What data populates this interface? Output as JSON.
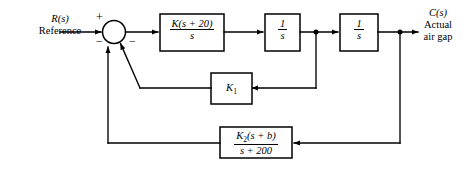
{
  "diagram": {
    "background_color": "#ffffff",
    "line_color": "#000000",
    "input": {
      "symbol": "R(s)",
      "description": "Reference"
    },
    "output": {
      "symbol": "C(s)",
      "description_line1": "Actual",
      "description_line2": "air gap"
    },
    "summing_junction": {
      "name": "summing-junction",
      "signs": [
        {
          "id": "input-sign",
          "value": "+"
        },
        {
          "id": "inner-feedback-sign",
          "value": "−"
        },
        {
          "id": "outer-feedback-sign",
          "value": "−"
        }
      ]
    },
    "blocks": [
      {
        "id": "controller",
        "numerator": "K(s + 20)",
        "denominator": "s",
        "is_fraction": true
      },
      {
        "id": "integrator-1",
        "numerator": "1",
        "denominator": "s",
        "is_fraction": true
      },
      {
        "id": "integrator-2",
        "numerator": "1",
        "denominator": "s",
        "is_fraction": true
      },
      {
        "id": "inner-feedback-gain",
        "label": "K",
        "subscript": "1",
        "is_fraction": false
      },
      {
        "id": "outer-feedback-compensator",
        "numerator_main": "K",
        "numerator_sub": "2",
        "numerator_rest": "(s + b)",
        "denominator": "s + 200",
        "is_fraction": true
      }
    ]
  }
}
